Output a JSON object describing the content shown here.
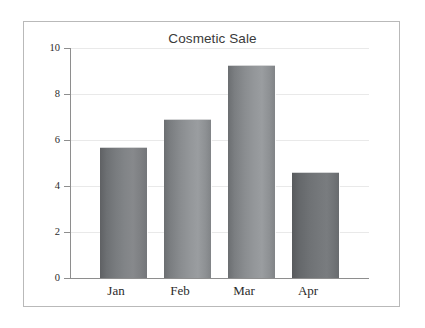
{
  "chart_data": {
    "type": "bar",
    "title": "Cosmetic Sale",
    "xlabel": "",
    "ylabel": "",
    "categories": [
      "Jan",
      "Feb",
      "Mar",
      "Apr"
    ],
    "values": [
      5.7,
      6.9,
      9.25,
      4.6
    ],
    "ylim": [
      0,
      10
    ],
    "yticks": [
      0,
      2,
      4,
      6,
      8,
      10
    ],
    "ytick_labels": [
      "0",
      "2",
      "4",
      "6",
      "8",
      "10"
    ],
    "grid": true,
    "legend": false,
    "series": [
      {
        "name": "Cosmetic Sale",
        "values": [
          5.7,
          6.9,
          9.25,
          4.6
        ]
      }
    ],
    "colors": {
      "bar_dark_edge": "#5f6164",
      "bar_light_center": "#8a8d90",
      "axis": "#8e8e8e",
      "gridline": "#e9e9e9",
      "frame": "#b9b9b9",
      "title_text": "#3a3a3a",
      "tick_text": "#2b2b2b",
      "background": "#ffffff"
    }
  }
}
